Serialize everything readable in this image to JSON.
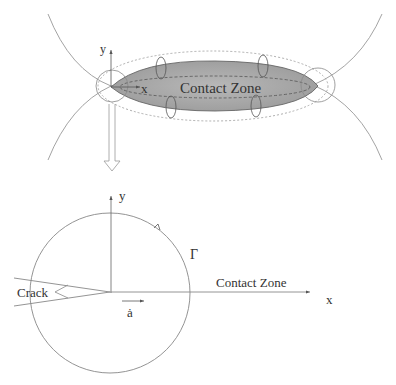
{
  "figure": {
    "top_panel": {
      "contact_zone_label": "Contact Zone",
      "x_axis_label": "x",
      "y_axis_label": "y",
      "contact_fill_color": "#a8a8a8",
      "line_color": "#888888"
    },
    "transition_arrow": {
      "icon": "hollow-down-arrow-icon"
    },
    "bottom_panel": {
      "crack_label": "Crack",
      "contour_label": "Γ",
      "contact_zone_label": "Contact Zone",
      "x_axis_label": "x",
      "y_axis_label": "y",
      "crack_velocity_label": "ȧ",
      "line_color": "#888888"
    }
  }
}
